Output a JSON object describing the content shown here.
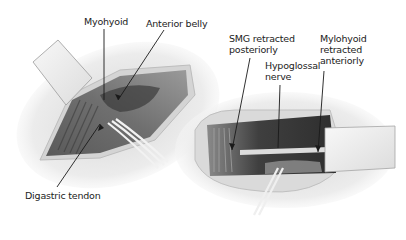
{
  "figure": {
    "type": "surgical-illustration",
    "panels": [
      {
        "id": "left",
        "description": "Submandibular triangle exposure showing myohyoid, anterior belly and digastric tendon with retractor"
      },
      {
        "id": "right",
        "description": "Submandibular gland retracted posteriorly and mylohyoid retracted anteriorly exposing hypoglossal nerve"
      }
    ],
    "labels": {
      "myohyoid": "Myohyoid",
      "anterior_belly": "Anterior belly",
      "digastric_tendon": "Digastric tendon",
      "smg_retracted": "SMG retracted\nposteriorly",
      "hypoglossal_nerve": "Hypoglossal\nnerve",
      "mylohyoid_retracted": "Mylohyoid\nretracted\nanteriorly"
    },
    "colors": {
      "skin": "#e6e6e6",
      "wound_edge": "#cfcfcf",
      "muscle_dark": "#4a4a4a",
      "muscle_mid": "#7a7a7a",
      "retractor": "#f4f4f4",
      "text": "#222222"
    }
  }
}
